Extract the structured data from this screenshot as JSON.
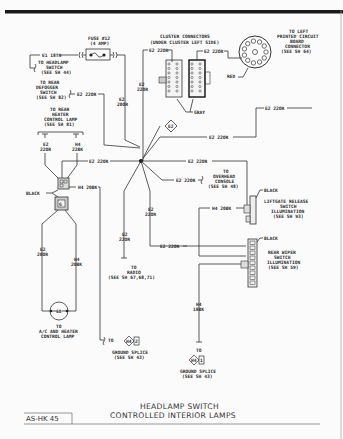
{
  "diagram": {
    "title_line1": "HEADLAMP SWITCH",
    "title_line2": "CONTROLLED INTERIOR LAMPS",
    "sheet_id": "AS-HK 45",
    "colors": {
      "ink": "#333333",
      "background": "#fbfbfb",
      "header_bar": "#1a1a1a"
    },
    "fuse": {
      "label1": "FUSE #12",
      "label2": "(4 AMP)",
      "input_wire": "E1 18TN",
      "output_wire_1": "E2",
      "output_wire_2": "20OR"
    },
    "headlamp_switch_ref": [
      "TO HEADLAMP",
      "SWITCH",
      "(SEE SH 44)"
    ],
    "rear_defogger": {
      "ref": [
        "TO REAR",
        "DEFOGGER",
        "SWITCH",
        "(SEE SH 82)"
      ],
      "wire": "E2 22OR"
    },
    "rear_heater": {
      "ref": [
        "TO REAR",
        "HEATER",
        "CONTROL LAMP",
        "(SEE SH 81)"
      ],
      "wire_a_1": "E2",
      "wire_a_2": "22OR",
      "wire_b_1": "H4",
      "wire_b_2": "22BK"
    },
    "cluster": {
      "title1": "CLUSTER CONNECTORS",
      "title2": "(UNDER CLUSTER LEFT SIDE)",
      "wire_left": "E2 22OR",
      "wire_right": "E2 22OR",
      "vertical_wire_1": "E2",
      "vertical_wire_2": "22OR",
      "color_label": "GRAY"
    },
    "pcb": {
      "ref": [
        "TO LEFT",
        "PRINTED CIRCUIT",
        "BOARD",
        "CONNECTOR",
        "(SEE SH 64)"
      ],
      "color_label": "RED"
    },
    "splice": {
      "id": "E2"
    },
    "wires": {
      "top_right": "E2 22OR",
      "mid_right": "E2 22OR",
      "left_mid": "E2 22OR",
      "mid_right_2": "E2 22OR",
      "overhead": "E2 22OR",
      "lower_center_1": "E2",
      "lower_center_2": "22OR",
      "lower_left_1": "E2",
      "lower_left_2": "22OR",
      "rear_wiper_feed": "E2 22OR",
      "liftgate_ground": "H4 20BK",
      "black_conn_ground": "H4 20BK",
      "ac_e2_1": "E2",
      "ac_e2_2": "20OR",
      "ac_h4_1": "H4",
      "ac_h4_2": "20BK",
      "rear_ground_1": "H4",
      "rear_ground_2": "18BK"
    },
    "overhead_console": {
      "ref": [
        "TO",
        "OVERHEAD",
        "CONSOLE",
        "(SEE SH 48)"
      ]
    },
    "radio": {
      "ref": [
        "TO",
        "RADIO",
        "(SEE SH 67,68,71)"
      ]
    },
    "liftgate": {
      "color_label": "BLACK",
      "ref": [
        "LIFTGATE RELEASE",
        "SWITCH",
        "ILLUMINATION",
        "(SEE SH 93)"
      ]
    },
    "rear_wiper": {
      "color_label": "BLACK",
      "ref": [
        "REAR WIPER",
        "SWITCH",
        "ILLUMINATION",
        "(SEE SH 59)"
      ]
    },
    "black_connector": {
      "color_label": "BLACK"
    },
    "ac_lamp": {
      "bulb": "60",
      "ref": [
        "TO",
        "A/C AND HEATER",
        "CONTROL LAMP"
      ]
    },
    "ground_left": {
      "to": "TO",
      "splice_id": "H4",
      "splice_num": "2",
      "ref": [
        "GROUND SPLICE",
        "(SEE SH 43)"
      ]
    },
    "ground_right": {
      "to": "TO",
      "splice_id": "H4",
      "splice_num": "1",
      "ref": [
        "GROUND SPLICE",
        "(SEE SH 43)"
      ]
    }
  }
}
